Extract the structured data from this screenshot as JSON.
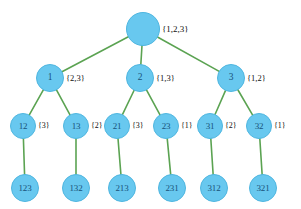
{
  "figure": {
    "node_fill": "#68c8ef",
    "node_stroke": "#4fb6e0",
    "edge_color": "#5ba352",
    "label_color": "#111111",
    "node_text_color": "#18527a",
    "background": "#ffffff"
  },
  "chart_data": {
    "type": "diagram",
    "subtype": "tree",
    "levels": 4,
    "root_set": "{1,2,3}"
  },
  "nodes": [
    {
      "id": "root",
      "label": "",
      "set": "{1,2,3}",
      "level": 0,
      "cx": 143,
      "cy": 29,
      "r": 17
    },
    {
      "id": "n1",
      "label": "1",
      "set": "{2,3}",
      "level": 1,
      "cx": 50,
      "cy": 78,
      "r": 14
    },
    {
      "id": "n2",
      "label": "2",
      "set": "{1,3}",
      "level": 1,
      "cx": 140,
      "cy": 78,
      "r": 14
    },
    {
      "id": "n3",
      "label": "3",
      "set": "{1,2}",
      "level": 1,
      "cx": 231,
      "cy": 78,
      "r": 14
    },
    {
      "id": "n12",
      "label": "12",
      "set": "{3}",
      "level": 2,
      "cx": 23,
      "cy": 126,
      "r": 13
    },
    {
      "id": "n13",
      "label": "13",
      "set": "{2}",
      "level": 2,
      "cx": 76,
      "cy": 126,
      "r": 13
    },
    {
      "id": "n21",
      "label": "21",
      "set": "{3}",
      "level": 2,
      "cx": 117,
      "cy": 126,
      "r": 13
    },
    {
      "id": "n23",
      "label": "23",
      "set": "{1}",
      "level": 2,
      "cx": 166,
      "cy": 126,
      "r": 13
    },
    {
      "id": "n31",
      "label": "31",
      "set": "{2}",
      "level": 2,
      "cx": 210,
      "cy": 126,
      "r": 13
    },
    {
      "id": "n32",
      "label": "32",
      "set": "{1}",
      "level": 2,
      "cx": 259,
      "cy": 126,
      "r": 13
    },
    {
      "id": "n123",
      "label": "123",
      "set": "",
      "level": 3,
      "cx": 25,
      "cy": 188,
      "r": 14
    },
    {
      "id": "n132",
      "label": "132",
      "set": "",
      "level": 3,
      "cx": 76,
      "cy": 188,
      "r": 14
    },
    {
      "id": "n213",
      "label": "213",
      "set": "",
      "level": 3,
      "cx": 122,
      "cy": 188,
      "r": 14
    },
    {
      "id": "n231",
      "label": "231",
      "set": "",
      "level": 3,
      "cx": 172,
      "cy": 188,
      "r": 14
    },
    {
      "id": "n312",
      "label": "312",
      "set": "",
      "level": 3,
      "cx": 214,
      "cy": 188,
      "r": 14
    },
    {
      "id": "n321",
      "label": "321",
      "set": "",
      "level": 3,
      "cx": 263,
      "cy": 188,
      "r": 14
    }
  ],
  "edges": [
    {
      "from": "root",
      "to": "n1"
    },
    {
      "from": "root",
      "to": "n2"
    },
    {
      "from": "root",
      "to": "n3"
    },
    {
      "from": "n1",
      "to": "n12"
    },
    {
      "from": "n1",
      "to": "n13"
    },
    {
      "from": "n2",
      "to": "n21"
    },
    {
      "from": "n2",
      "to": "n23"
    },
    {
      "from": "n3",
      "to": "n31"
    },
    {
      "from": "n3",
      "to": "n32"
    },
    {
      "from": "n12",
      "to": "n123"
    },
    {
      "from": "n13",
      "to": "n132"
    },
    {
      "from": "n21",
      "to": "n213"
    },
    {
      "from": "n23",
      "to": "n231"
    },
    {
      "from": "n31",
      "to": "n312"
    },
    {
      "from": "n32",
      "to": "n321"
    }
  ]
}
